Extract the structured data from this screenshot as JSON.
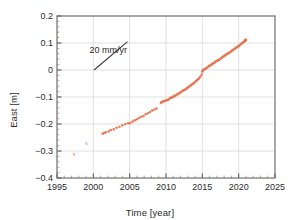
{
  "chart_data": {
    "type": "scatter",
    "title": "",
    "xlabel": "Time [year]",
    "ylabel": "East [m]",
    "xlim": [
      1995,
      2025
    ],
    "ylim": [
      -0.4,
      0.2
    ],
    "xticks": [
      "1995",
      "2000",
      "2005",
      "2010",
      "2015",
      "2020",
      "2025"
    ],
    "xtick_values": [
      1995,
      2000,
      2005,
      2010,
      2015,
      2020,
      2025
    ],
    "yticks": [
      "0.2",
      "0.1",
      "0",
      "-0.1",
      "-0.2",
      "-0.3",
      "-0.4"
    ],
    "ytick_values": [
      0.2,
      0.1,
      0,
      -0.1,
      -0.2,
      -0.3,
      -0.4
    ],
    "grid": true,
    "legend": "none",
    "point_color": "#e8714d",
    "point_color_faint": "#f0a98f",
    "annotations": [
      {
        "text": "20 mm/yr",
        "x": 1999.6,
        "y": 0.072,
        "slope_line": {
          "x1": 2000.1,
          "y1": 0.0,
          "x2": 2004.7,
          "y2": 0.105
        }
      }
    ],
    "series": [
      {
        "name": "East displacement",
        "color": "#e8714d",
        "trend_mm_per_yr": 20,
        "points": [
          [
            1997.3,
            -0.313
          ],
          [
            1997.35,
            -0.309
          ],
          [
            1997.4,
            -0.316
          ],
          [
            1999.0,
            -0.272
          ],
          [
            1999.05,
            -0.268
          ],
          [
            1999.12,
            -0.275
          ],
          [
            2001.3,
            -0.236
          ],
          [
            2001.5,
            -0.233
          ],
          [
            2001.7,
            -0.231
          ],
          [
            2002.1,
            -0.228
          ],
          [
            2002.4,
            -0.222
          ],
          [
            2002.8,
            -0.219
          ],
          [
            2003.2,
            -0.214
          ],
          [
            2003.6,
            -0.21
          ],
          [
            2004.0,
            -0.205
          ],
          [
            2004.4,
            -0.2
          ],
          [
            2004.8,
            -0.197
          ],
          [
            2005.1,
            -0.196
          ],
          [
            2005.4,
            -0.191
          ],
          [
            2005.7,
            -0.186
          ],
          [
            2006.0,
            -0.182
          ],
          [
            2006.3,
            -0.177
          ],
          [
            2006.6,
            -0.173
          ],
          [
            2006.9,
            -0.17
          ],
          [
            2007.2,
            -0.164
          ],
          [
            2007.5,
            -0.16
          ],
          [
            2007.8,
            -0.156
          ],
          [
            2008.1,
            -0.15
          ],
          [
            2008.4,
            -0.146
          ],
          [
            2008.7,
            -0.143
          ],
          [
            2009.3,
            -0.121
          ],
          [
            2009.5,
            -0.118
          ],
          [
            2009.7,
            -0.116
          ],
          [
            2009.9,
            -0.114
          ],
          [
            2010.1,
            -0.112
          ],
          [
            2010.3,
            -0.11
          ],
          [
            2010.5,
            -0.106
          ],
          [
            2010.7,
            -0.103
          ],
          [
            2010.9,
            -0.1
          ],
          [
            2011.1,
            -0.097
          ],
          [
            2011.3,
            -0.094
          ],
          [
            2011.5,
            -0.091
          ],
          [
            2011.7,
            -0.088
          ],
          [
            2011.9,
            -0.085
          ],
          [
            2012.1,
            -0.081
          ],
          [
            2012.3,
            -0.077
          ],
          [
            2012.5,
            -0.074
          ],
          [
            2012.7,
            -0.071
          ],
          [
            2012.9,
            -0.067
          ],
          [
            2013.1,
            -0.063
          ],
          [
            2013.3,
            -0.059
          ],
          [
            2013.5,
            -0.055
          ],
          [
            2013.7,
            -0.051
          ],
          [
            2013.9,
            -0.047
          ],
          [
            2014.1,
            -0.042
          ],
          [
            2014.3,
            -0.037
          ],
          [
            2014.5,
            -0.032
          ],
          [
            2014.7,
            -0.026
          ],
          [
            2014.9,
            -0.018
          ],
          [
            2015.0,
            -0.006
          ],
          [
            2015.1,
            0.0
          ],
          [
            2015.3,
            0.003
          ],
          [
            2015.5,
            0.006
          ],
          [
            2015.7,
            0.01
          ],
          [
            2015.9,
            0.014
          ],
          [
            2016.1,
            0.018
          ],
          [
            2016.3,
            0.021
          ],
          [
            2016.5,
            0.025
          ],
          [
            2016.7,
            0.028
          ],
          [
            2016.9,
            0.032
          ],
          [
            2017.1,
            0.035
          ],
          [
            2017.3,
            0.038
          ],
          [
            2017.5,
            0.042
          ],
          [
            2017.7,
            0.046
          ],
          [
            2017.9,
            0.05
          ],
          [
            2018.1,
            0.054
          ],
          [
            2018.3,
            0.057
          ],
          [
            2018.5,
            0.061
          ],
          [
            2018.7,
            0.064
          ],
          [
            2018.9,
            0.068
          ],
          [
            2019.1,
            0.072
          ],
          [
            2019.3,
            0.076
          ],
          [
            2019.5,
            0.08
          ],
          [
            2019.7,
            0.083
          ],
          [
            2019.9,
            0.087
          ],
          [
            2020.1,
            0.091
          ],
          [
            2020.3,
            0.095
          ],
          [
            2020.5,
            0.1
          ],
          [
            2020.7,
            0.104
          ],
          [
            2020.85,
            0.108
          ],
          [
            2020.95,
            0.11
          ],
          [
            2021.0,
            0.112
          ]
        ]
      }
    ]
  }
}
